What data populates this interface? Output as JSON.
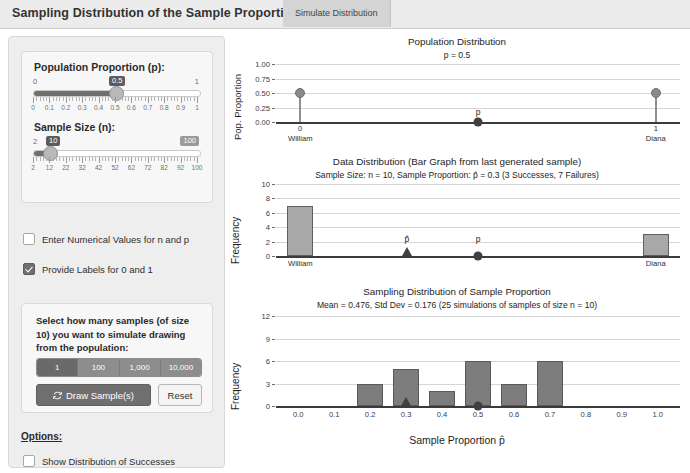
{
  "header": {
    "title": "Sampling Distribution of the Sample Proportion",
    "tab_label": "Simulate Distribution"
  },
  "controls": {
    "p_slider": {
      "label": "Population Proportion (p):",
      "value": "0.5",
      "min_label": "0",
      "max_label": "1",
      "ticks": [
        "0",
        "0.1",
        "0.2",
        "0.3",
        "0.4",
        "0.5",
        "0.6",
        "0.7",
        "0.8",
        "0.9",
        "1"
      ]
    },
    "n_slider": {
      "label": "Sample Size (n):",
      "value": "10",
      "min_label": "2",
      "max_label": "100",
      "ticks": [
        "2",
        "12",
        "22",
        "32",
        "42",
        "52",
        "62",
        "72",
        "82",
        "92",
        "100"
      ]
    },
    "checkbox_numeric": {
      "label": "Enter Numerical Values for n and p",
      "checked": false
    },
    "checkbox_labels": {
      "label": "Provide Labels for 0 and 1",
      "checked": true
    },
    "simulate": {
      "instruction": "Select how many samples (of size 10) you want to simulate drawing from the population:",
      "options": [
        "1",
        "100",
        "1,000",
        "10,000"
      ],
      "selected": "1",
      "draw_button": "Draw Sample(s)",
      "reset_button": "Reset"
    },
    "options": {
      "title": "Options:",
      "items": [
        {
          "label": "Show Distribution of Successes",
          "checked": false
        },
        {
          "label": "Show Normal Approximation",
          "checked": false
        }
      ]
    }
  },
  "chart_data": [
    {
      "type": "bar",
      "id": "population",
      "title": "Population Distribution",
      "subtitle": "p = 0.5",
      "xlabel": "",
      "ylabel": "Pop. Proportion",
      "categories": [
        "0",
        "1"
      ],
      "category_labels": [
        "William",
        "Diana"
      ],
      "values": [
        0.5,
        0.5
      ],
      "ylim": [
        0,
        1
      ],
      "yticks": [
        "0.00",
        "0.25",
        "0.50",
        "0.75",
        "1.00"
      ],
      "grid": true,
      "annotations": [
        {
          "text": "p",
          "x": 0.5,
          "y": 0,
          "marker": "circle"
        }
      ]
    },
    {
      "type": "bar",
      "id": "data",
      "title": "Data Distribution (Bar Graph from last generated sample)",
      "subtitle": "Sample Size: n = 10, Sample Proportion: p̂ = 0.3  (3 Successes, 7 Failures)",
      "xlabel": "",
      "ylabel": "Frequency",
      "categories": [
        "William",
        "Diana"
      ],
      "values": [
        7,
        3
      ],
      "ylim": [
        0,
        10
      ],
      "yticks": [
        "0",
        "2",
        "4",
        "6",
        "8",
        "10"
      ],
      "grid": true,
      "annotations": [
        {
          "text": "p̂",
          "x": 0.3,
          "y": 0,
          "marker": "triangle"
        },
        {
          "text": "p",
          "x": 0.5,
          "y": 0,
          "marker": "circle"
        }
      ]
    },
    {
      "type": "bar",
      "id": "sampling",
      "title": "Sampling Distribution of Sample Proportion",
      "subtitle": "Mean = 0.476, Std Dev = 0.176 (25 simulations of samples of size n = 10)",
      "xlabel": "Sample Proportion p̂",
      "ylabel": "Frequency",
      "categories": [
        "0.0",
        "0.1",
        "0.2",
        "0.3",
        "0.4",
        "0.5",
        "0.6",
        "0.7",
        "0.8",
        "0.9",
        "1.0"
      ],
      "values": [
        0,
        0,
        3,
        5,
        2,
        6,
        3,
        6,
        0,
        0,
        0
      ],
      "ylim": [
        0,
        12
      ],
      "yticks": [
        "0",
        "3",
        "6",
        "9",
        "12"
      ],
      "grid": true,
      "annotations": [
        {
          "text": "",
          "x": 0.3,
          "y": 0,
          "marker": "triangle"
        },
        {
          "text": "",
          "x": 0.5,
          "y": 0,
          "marker": "circle"
        }
      ]
    }
  ],
  "colors": {
    "bar_light": "#a8a8a8",
    "bar_dark": "#7d7d7d",
    "accent": "#6f6f6f",
    "panel": "#eeeeee",
    "header": "#ececec"
  }
}
